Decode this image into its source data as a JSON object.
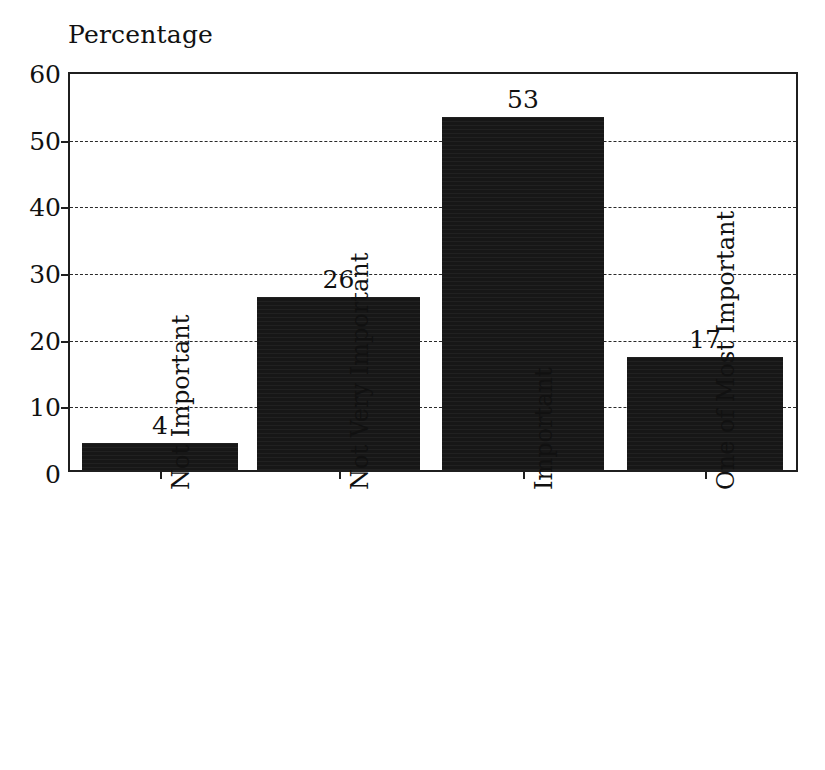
{
  "chart_data": {
    "type": "bar",
    "title": "Percentage",
    "xlabel": "",
    "ylabel": "Percentage",
    "categories": [
      "Not Important",
      "Not Very Important",
      "Important",
      "One of Most Important"
    ],
    "values": [
      4,
      26,
      53,
      17
    ],
    "value_labels": [
      "4",
      "26",
      "53",
      "17"
    ],
    "ylim": [
      0,
      60
    ],
    "yticks": [
      0,
      10,
      20,
      30,
      40,
      50,
      60
    ],
    "ytick_labels": [
      "0",
      "10",
      "20",
      "30",
      "40",
      "50",
      "60"
    ],
    "grid": "horizontal-dashed",
    "legend": "none",
    "series": [
      {
        "name": "Percentage",
        "values": [
          4,
          26,
          53,
          17
        ]
      }
    ],
    "colors": {
      "bar": "#171717",
      "axis": "#1f1f1f",
      "grid": "#2a2a2a",
      "text": "#111111",
      "background": "#ffffff"
    }
  }
}
